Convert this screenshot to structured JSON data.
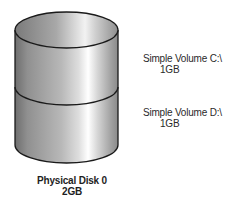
{
  "diagram": {
    "type": "disk-volume-diagram",
    "disk": {
      "name": "Physical Disk 0",
      "size": "2GB",
      "icon": "cylinder-disk-icon"
    },
    "volumes": [
      {
        "name": "Simple Volume C:\\",
        "size": "1GB",
        "position": "top"
      },
      {
        "name": "Simple Volume D:\\",
        "size": "1GB",
        "position": "bottom"
      }
    ],
    "colors": {
      "outline": "#1a1a1a",
      "shade_dark": "#7a7a7a",
      "shade_mid": "#b4b4b4",
      "highlight": "#ffffff",
      "background": "#ffffff"
    }
  }
}
